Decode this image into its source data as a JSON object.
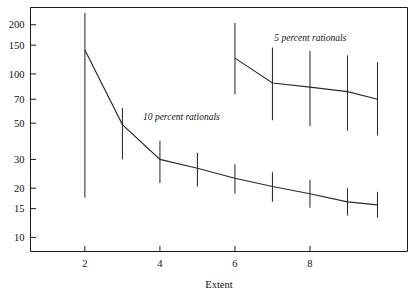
{
  "chart_data": {
    "type": "line",
    "title": "",
    "xlabel": "Extent",
    "ylabel": "",
    "yscale": "log",
    "xlim": [
      0.55,
      10.6
    ],
    "ylim": [
      8.2,
      255
    ],
    "grid": false,
    "legend_position": "inline-annotation",
    "xticks": [
      2,
      4,
      6,
      8
    ],
    "xtick_labels": [
      "2",
      "4",
      "6",
      "8"
    ],
    "yticks": [
      200,
      150,
      100,
      70,
      50,
      30,
      20,
      15,
      10
    ],
    "ytick_labels": [
      "200",
      "150",
      "100",
      "70",
      "50",
      "30",
      "20",
      "15",
      "10"
    ],
    "series": [
      {
        "name": "10 percent rationals",
        "label": "10 percent rationals",
        "x": [
          2,
          3,
          4,
          5,
          6,
          7,
          8,
          9,
          9.8
        ],
        "values": [
          140,
          49,
          30,
          26.5,
          23,
          20.5,
          18.5,
          16.5,
          15.8
        ],
        "err_low": [
          17.5,
          30,
          21.5,
          20.5,
          18.5,
          16.5,
          15.2,
          13.6,
          13.2
        ],
        "err_high": [
          237,
          62,
          39,
          33,
          28,
          25,
          22.5,
          20,
          19
        ],
        "color": "#2b2b2b"
      },
      {
        "name": "5 percent rationals",
        "label": "5 percent rationals",
        "x": [
          6,
          7,
          8,
          9,
          9.8
        ],
        "values": [
          125,
          88,
          83,
          78,
          70
        ],
        "err_low": [
          75,
          52,
          48,
          45,
          42
        ],
        "err_high": [
          205,
          145,
          138,
          130,
          118
        ],
        "color": "#2b2b2b"
      }
    ],
    "annotations": [
      {
        "text": "10 percent rationals",
        "x": 3.55,
        "y": 52,
        "style": "italic"
      },
      {
        "text": "5 percent rationals",
        "x": 7.05,
        "y": 160,
        "style": "italic"
      }
    ]
  }
}
